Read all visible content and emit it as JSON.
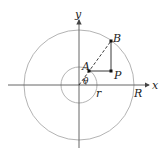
{
  "diagram": {
    "labels": {
      "x_axis": "x",
      "y_axis": "y",
      "point_A": "A",
      "point_B": "B",
      "point_P": "P",
      "angle": "θ",
      "inner_radius": "r",
      "outer_radius": "R"
    },
    "colors": {
      "axes": "#555555",
      "circles": "#aaaaaa",
      "lines": "#222222",
      "points": "#111111"
    }
  }
}
